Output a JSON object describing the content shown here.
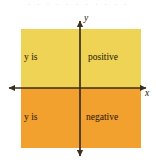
{
  "figure": {
    "name": "sign-of-y-coordinate-plane-diagram",
    "top_bleed_text": "· · · · · · · · · · ·",
    "background_color": "#ffffff"
  },
  "regions": {
    "upper_half": {
      "name": "upper-half-plane",
      "color": "#efd355",
      "label_left": "y is",
      "label_right": "positive"
    },
    "lower_half": {
      "name": "lower-half-plane",
      "color": "#f2a02e",
      "label_left": "y is",
      "label_right": "negative"
    }
  },
  "axes": {
    "color": "#3a2e1e",
    "x_label": "x",
    "y_label": "y",
    "origin": {
      "x": 80,
      "y": 88
    },
    "x_extent": [
      3,
      152
    ],
    "y_extent": [
      15,
      162
    ]
  }
}
